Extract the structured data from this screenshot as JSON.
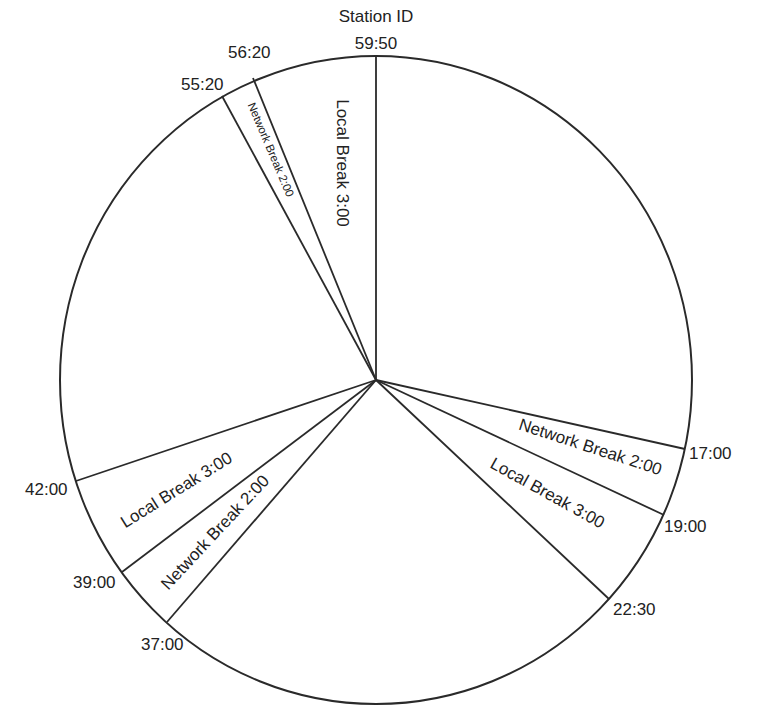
{
  "diagram": {
    "title": "Station ID",
    "type": "broadcast-hour-clock",
    "style": {
      "line_color": "#2a2a2a",
      "text_color": "#222222",
      "background": "#ffffff"
    },
    "time_markers": [
      {
        "id": "t5950",
        "label": "59:50"
      },
      {
        "id": "t1700",
        "label": "17:00"
      },
      {
        "id": "t1900",
        "label": "19:00"
      },
      {
        "id": "t2230",
        "label": "22:30"
      },
      {
        "id": "t3700",
        "label": "37:00"
      },
      {
        "id": "t3900",
        "label": "39:00"
      },
      {
        "id": "t4200",
        "label": "42:00"
      },
      {
        "id": "t5520",
        "label": "55:20"
      },
      {
        "id": "t5620",
        "label": "56:20"
      }
    ],
    "segments": [
      {
        "id": "net1",
        "label": "Network Break 2:00",
        "start": "17:00",
        "end": "19:00"
      },
      {
        "id": "loc1",
        "label": "Local Break 3:00",
        "start": "19:00",
        "end": "22:30"
      },
      {
        "id": "net2",
        "label": "Network Break 2:00",
        "start": "37:00",
        "end": "39:00"
      },
      {
        "id": "loc2",
        "label": "Local Break 3:00",
        "start": "39:00",
        "end": "42:00"
      },
      {
        "id": "net3",
        "label": "Network Break 2:00",
        "start": "55:20",
        "end": "56:20"
      },
      {
        "id": "loc3",
        "label": "Local Break 3:00",
        "start": "56:20",
        "end": "59:50"
      }
    ]
  }
}
